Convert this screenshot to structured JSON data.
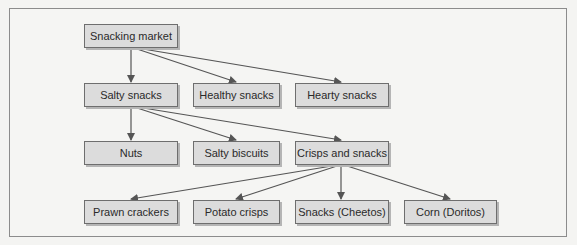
{
  "diagram": {
    "type": "hierarchy-tree",
    "nodes": [
      {
        "id": "snacking_market",
        "label": "Snacking market",
        "level": 0
      },
      {
        "id": "salty_snacks",
        "label": "Salty snacks",
        "level": 1,
        "parent": "snacking_market"
      },
      {
        "id": "healthy_snacks",
        "label": "Healthy snacks",
        "level": 1,
        "parent": "snacking_market"
      },
      {
        "id": "hearty_snacks",
        "label": "Hearty snacks",
        "level": 1,
        "parent": "snacking_market"
      },
      {
        "id": "nuts",
        "label": "Nuts",
        "level": 2,
        "parent": "salty_snacks"
      },
      {
        "id": "salty_biscuits",
        "label": "Salty biscuits",
        "level": 2,
        "parent": "salty_snacks"
      },
      {
        "id": "crisps_and_snacks",
        "label": "Crisps and snacks",
        "level": 2,
        "parent": "salty_snacks"
      },
      {
        "id": "prawn_crackers",
        "label": "Prawn crackers",
        "level": 3,
        "parent": "crisps_and_snacks"
      },
      {
        "id": "potato_crisps",
        "label": "Potato crisps",
        "level": 3,
        "parent": "crisps_and_snacks"
      },
      {
        "id": "snacks_cheetos",
        "label": "Snacks (Cheetos)",
        "level": 3,
        "parent": "crisps_and_snacks"
      },
      {
        "id": "corn_doritos",
        "label": "Corn (Doritos)",
        "level": 3,
        "parent": "crisps_and_snacks"
      }
    ],
    "edges": [
      {
        "from": "snacking_market",
        "to": "salty_snacks"
      },
      {
        "from": "snacking_market",
        "to": "healthy_snacks"
      },
      {
        "from": "snacking_market",
        "to": "hearty_snacks"
      },
      {
        "from": "salty_snacks",
        "to": "nuts"
      },
      {
        "from": "salty_snacks",
        "to": "salty_biscuits"
      },
      {
        "from": "salty_snacks",
        "to": "crisps_and_snacks"
      },
      {
        "from": "crisps_and_snacks",
        "to": "prawn_crackers"
      },
      {
        "from": "crisps_and_snacks",
        "to": "potato_crisps"
      },
      {
        "from": "crisps_and_snacks",
        "to": "snacks_cheetos"
      },
      {
        "from": "crisps_and_snacks",
        "to": "corn_doritos"
      }
    ]
  },
  "colors": {
    "node_fill": "#dcdcdc",
    "node_border": "#6e6e6e",
    "edge": "#555555",
    "frame_border": "#8c8c8c",
    "background": "#f5f5f3"
  }
}
